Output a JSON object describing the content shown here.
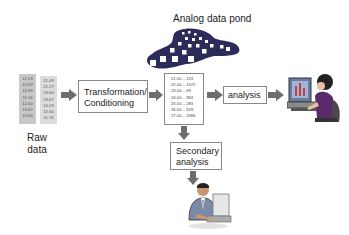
{
  "pond": {
    "label": "Analog data pond"
  },
  "raw_data": {
    "label_line1": "Raw",
    "label_line2": "data",
    "col1": [
      "12.09",
      "13.09",
      "14.96",
      "11.06",
      "12.60",
      "13.67",
      "15.60"
    ],
    "col2": [
      "21.09",
      "21.27",
      "19.60",
      "23.67",
      "14.09",
      "15.60",
      "11.76"
    ]
  },
  "transformation": {
    "line1": "Transformation/",
    "line2": "Conditioning"
  },
  "processed_list": [
    "21.00 – 153",
    "22.00 – 1072",
    "23.00 – 69",
    "24.00 – 963",
    "25.00 – 283",
    "26.00 – 519",
    "27.00 – 1584"
  ],
  "analysis": {
    "label": "analysis"
  },
  "secondary": {
    "line1": "Secondary",
    "line2": "analysis"
  },
  "colors": {
    "arrow": "#6e6e6e",
    "box_border": "#888888",
    "raw_fill": "#c8c8c8",
    "pond": "#2c2c5a"
  }
}
